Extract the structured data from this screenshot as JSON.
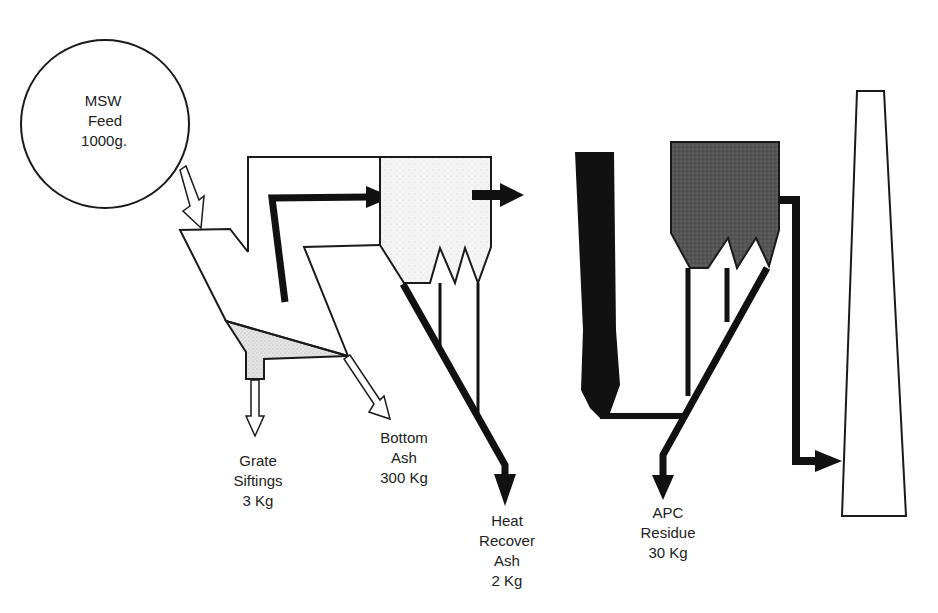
{
  "diagram": {
    "type": "process-flow",
    "colors": {
      "line": "#1a1a1a",
      "boiler_fill": "#f2f2f2",
      "apc_fill": "#5a5a5a",
      "siftings_fill": "#d9d9d9",
      "background": "#ffffff"
    },
    "nodes": {
      "feed": {
        "lines": [
          "MSW",
          "Feed",
          "1000g."
        ]
      },
      "grate_siftings": {
        "lines": [
          "Grate",
          "Siftings",
          "3 Kg"
        ]
      },
      "bottom_ash": {
        "lines": [
          "Bottom",
          "Ash",
          "300 Kg"
        ]
      },
      "heat_recovery_ash": {
        "lines": [
          "Heat",
          "Recover",
          "Ash",
          "2 Kg"
        ]
      },
      "apc_residue": {
        "lines": [
          "APC",
          "Residue",
          "30 Kg"
        ]
      }
    },
    "components": [
      "feed-hopper",
      "furnace-grate",
      "boiler-heat-recovery",
      "scrubber",
      "fabric-filter",
      "stack"
    ]
  }
}
